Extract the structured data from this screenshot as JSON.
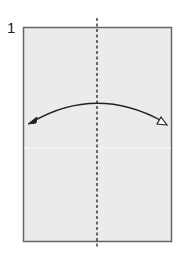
{
  "diagram": {
    "step_number": "1",
    "paper": {
      "fill": "#ebebeb",
      "stroke": "#666666"
    },
    "fold_line": {
      "style": "dashed",
      "orientation": "vertical",
      "type": "valley-fold"
    },
    "arrow": {
      "type": "fold-and-unfold",
      "direction": "left-to-right",
      "left_head": "filled",
      "right_head": "hollow"
    }
  }
}
